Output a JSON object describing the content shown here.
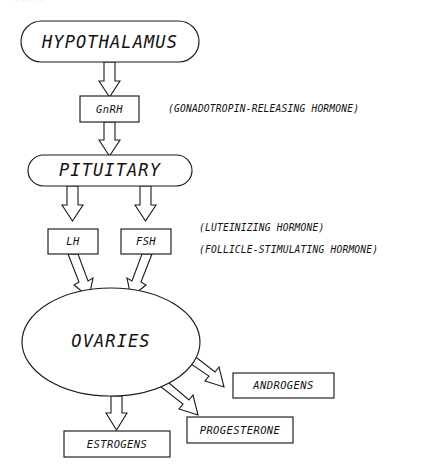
{
  "figure": {
    "cropped_header": "FIGURE",
    "background_color": "#ffffff",
    "line_color": "#1a1a1a"
  },
  "nodes": {
    "hypothalamus": {
      "label": "HYPOTHALAMUS",
      "shape": "rounded-rectangle"
    },
    "gnrh": {
      "label": "GnRH",
      "shape": "rectangle"
    },
    "pituitary": {
      "label": "PITUITARY",
      "shape": "rounded-rectangle"
    },
    "lh": {
      "label": "LH",
      "shape": "rectangle"
    },
    "fsh": {
      "label": "FSH",
      "shape": "rectangle"
    },
    "ovaries": {
      "label": "OVARIES",
      "shape": "ellipse"
    },
    "androgens": {
      "label": "ANDROGENS",
      "shape": "rectangle"
    },
    "progesterone": {
      "label": "PROGESTERONE",
      "shape": "rectangle"
    },
    "estrogens": {
      "label": "ESTROGENS",
      "shape": "rectangle"
    }
  },
  "annotations": {
    "gnrh_expansion": "(GONADOTROPIN-RELEASING HORMONE)",
    "lh_expansion": "(LUTEINIZING HORMONE)",
    "fsh_expansion": "(FOLLICLE-STIMULATING HORMONE)"
  },
  "flow": [
    {
      "from": "hypothalamus",
      "to": "gnrh"
    },
    {
      "from": "gnrh",
      "to": "pituitary"
    },
    {
      "from": "pituitary",
      "to": "lh"
    },
    {
      "from": "pituitary",
      "to": "fsh"
    },
    {
      "from": "lh",
      "to": "ovaries"
    },
    {
      "from": "fsh",
      "to": "ovaries"
    },
    {
      "from": "ovaries",
      "to": "androgens"
    },
    {
      "from": "ovaries",
      "to": "progesterone"
    },
    {
      "from": "ovaries",
      "to": "estrogens"
    }
  ]
}
